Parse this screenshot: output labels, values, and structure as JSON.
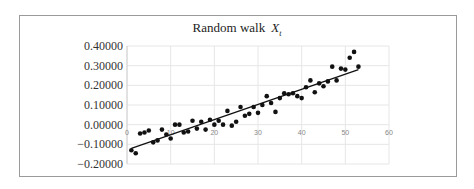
{
  "chart": {
    "title_prefix": "Random  walk",
    "title_var": "X",
    "title_sub": "t"
  },
  "chart_data": {
    "type": "scatter",
    "xlabel": "",
    "ylabel": "",
    "xlim": [
      0,
      60
    ],
    "ylim": [
      -0.2,
      0.4
    ],
    "x_ticks": [
      "0",
      "10",
      "20",
      "30",
      "40",
      "50",
      "60"
    ],
    "y_ticks": [
      "0.40000",
      "0.30000",
      "0.20000",
      "0.10000",
      "0.00000",
      "−0.10000",
      "−0.20000"
    ],
    "grid": true,
    "legend": "none",
    "series": [
      {
        "name": "X_t",
        "marker": "circle",
        "color": "#111111",
        "x": [
          1,
          2,
          3,
          4,
          5,
          6,
          7,
          8,
          9,
          10,
          11,
          12,
          13,
          14,
          15,
          16,
          17,
          18,
          19,
          20,
          21,
          22,
          23,
          24,
          25,
          26,
          27,
          28,
          29,
          30,
          31,
          32,
          33,
          34,
          35,
          36,
          37,
          38,
          39,
          40,
          41,
          42,
          43,
          44,
          45,
          46,
          47,
          48,
          49,
          50,
          51,
          52,
          53
        ],
        "y": [
          -0.13,
          -0.145,
          -0.045,
          -0.04,
          -0.03,
          -0.09,
          -0.08,
          -0.025,
          -0.05,
          -0.07,
          0.0,
          0.0,
          -0.04,
          -0.035,
          0.02,
          -0.02,
          0.015,
          -0.025,
          0.025,
          0.0,
          0.02,
          0.0,
          0.07,
          -0.005,
          0.015,
          0.09,
          0.045,
          0.055,
          0.09,
          0.06,
          0.1,
          0.145,
          0.11,
          0.065,
          0.135,
          0.16,
          0.155,
          0.16,
          0.145,
          0.135,
          0.19,
          0.225,
          0.165,
          0.21,
          0.195,
          0.22,
          0.295,
          0.225,
          0.285,
          0.28,
          0.34,
          0.37,
          0.295
        ]
      }
    ],
    "trendline": {
      "type": "linear",
      "x": [
        1,
        53
      ],
      "y": [
        -0.12,
        0.28
      ],
      "color": "#111111"
    }
  }
}
